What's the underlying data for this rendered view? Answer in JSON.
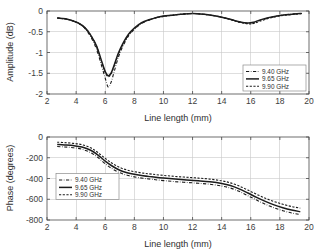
{
  "figure": {
    "background": "#ffffff",
    "panels": [
      "amplitude",
      "phase"
    ]
  },
  "chart_data": [
    {
      "type": "line",
      "id": "amplitude",
      "title": "",
      "xlabel": "Line length (mm)",
      "ylabel": "Amplitude (dB)",
      "xlim": [
        2,
        20
      ],
      "ylim": [
        -2,
        0
      ],
      "xticks": [
        2,
        4,
        6,
        8,
        10,
        12,
        14,
        16,
        18,
        20
      ],
      "xticklabels": [
        "2",
        "4",
        "6",
        "8",
        "10",
        "12",
        "14",
        "16",
        "18",
        "20"
      ],
      "yticks": [
        0,
        -0.5,
        -1,
        -1.5,
        -2
      ],
      "yticklabels": [
        "0",
        "-0.5",
        "-1",
        "-1.5",
        "-2"
      ],
      "grid": true,
      "legend_position": "lower right",
      "linecolor": "#1c1c1c",
      "series": [
        {
          "name": "9.40 GHz",
          "style": "dashdot",
          "x": [
            2.7,
            3.0,
            3.4,
            3.8,
            4.2,
            4.6,
            5.0,
            5.4,
            5.8,
            6.0,
            6.2,
            6.4,
            6.6,
            6.9,
            7.2,
            7.6,
            8.0,
            8.5,
            9.0,
            9.5,
            10.0,
            10.6,
            11.2,
            12.0,
            12.8,
            13.4,
            14.0,
            14.6,
            15.2,
            15.8,
            16.2,
            16.6,
            17.2,
            17.8,
            18.4,
            19.0,
            19.5
          ],
          "y": [
            -0.17,
            -0.18,
            -0.2,
            -0.24,
            -0.3,
            -0.42,
            -0.62,
            -0.92,
            -1.38,
            -1.62,
            -1.83,
            -1.72,
            -1.48,
            -1.12,
            -0.86,
            -0.6,
            -0.44,
            -0.3,
            -0.22,
            -0.16,
            -0.13,
            -0.1,
            -0.08,
            -0.06,
            -0.08,
            -0.11,
            -0.15,
            -0.2,
            -0.26,
            -0.3,
            -0.28,
            -0.23,
            -0.17,
            -0.12,
            -0.09,
            -0.07,
            -0.06
          ]
        },
        {
          "name": "9.65 GHz",
          "style": "solid",
          "x": [
            2.7,
            3.0,
            3.4,
            3.8,
            4.2,
            4.6,
            5.0,
            5.4,
            5.8,
            6.0,
            6.2,
            6.4,
            6.6,
            6.9,
            7.2,
            7.6,
            8.0,
            8.5,
            9.0,
            9.5,
            10.0,
            10.6,
            11.2,
            12.0,
            12.8,
            13.4,
            14.0,
            14.6,
            15.2,
            15.8,
            16.2,
            16.6,
            17.2,
            17.8,
            18.4,
            19.0,
            19.5
          ],
          "y": [
            -0.17,
            -0.18,
            -0.2,
            -0.24,
            -0.3,
            -0.4,
            -0.58,
            -0.84,
            -1.26,
            -1.46,
            -1.56,
            -1.5,
            -1.32,
            -1.02,
            -0.79,
            -0.56,
            -0.41,
            -0.28,
            -0.21,
            -0.16,
            -0.12,
            -0.1,
            -0.08,
            -0.06,
            -0.08,
            -0.11,
            -0.15,
            -0.2,
            -0.26,
            -0.29,
            -0.27,
            -0.22,
            -0.16,
            -0.12,
            -0.09,
            -0.07,
            -0.06
          ]
        },
        {
          "name": "9.90 GHz",
          "style": "dashed",
          "x": [
            2.7,
            3.0,
            3.4,
            3.8,
            4.2,
            4.6,
            5.0,
            5.4,
            5.8,
            6.0,
            6.2,
            6.4,
            6.6,
            6.9,
            7.2,
            7.6,
            8.0,
            8.5,
            9.0,
            9.5,
            10.0,
            10.6,
            11.2,
            12.0,
            12.8,
            13.4,
            14.0,
            14.6,
            15.2,
            15.8,
            16.2,
            16.6,
            17.2,
            17.8,
            18.4,
            19.0,
            19.5
          ],
          "y": [
            -0.17,
            -0.18,
            -0.2,
            -0.24,
            -0.3,
            -0.4,
            -0.58,
            -0.85,
            -1.28,
            -1.48,
            -1.58,
            -1.52,
            -1.34,
            -1.05,
            -0.82,
            -0.58,
            -0.43,
            -0.29,
            -0.22,
            -0.16,
            -0.13,
            -0.1,
            -0.08,
            -0.06,
            -0.08,
            -0.11,
            -0.15,
            -0.21,
            -0.27,
            -0.31,
            -0.3,
            -0.25,
            -0.18,
            -0.13,
            -0.1,
            -0.08,
            -0.06
          ]
        }
      ]
    },
    {
      "type": "line",
      "id": "phase",
      "title": "",
      "xlabel": "Line length (mm)",
      "ylabel": "Phase (degrees)",
      "xlim": [
        2,
        20
      ],
      "ylim": [
        -800,
        0
      ],
      "xticks": [
        2,
        4,
        6,
        8,
        10,
        12,
        14,
        16,
        18,
        20
      ],
      "xticklabels": [
        "2",
        "4",
        "6",
        "8",
        "10",
        "12",
        "14",
        "16",
        "18",
        "20"
      ],
      "yticks": [
        0,
        -200,
        -400,
        -600,
        -800
      ],
      "yticklabels": [
        "0",
        "-200",
        "-400",
        "-600",
        "-800"
      ],
      "grid": true,
      "legend_position": "center left",
      "linecolor": "#1c1c1c",
      "series": [
        {
          "name": "9.40 GHz",
          "style": "dashdot",
          "x": [
            2.7,
            3.2,
            3.8,
            4.4,
            5.0,
            5.5,
            6.0,
            6.5,
            7.0,
            7.5,
            8.0,
            8.6,
            9.2,
            10.0,
            10.8,
            11.6,
            12.4,
            13.2,
            14.0,
            14.6,
            15.2,
            15.8,
            16.4,
            17.0,
            17.6,
            18.2,
            18.8,
            19.4
          ],
          "y": [
            -92,
            -96,
            -103,
            -118,
            -150,
            -198,
            -258,
            -308,
            -345,
            -368,
            -384,
            -398,
            -408,
            -420,
            -430,
            -438,
            -446,
            -456,
            -472,
            -492,
            -524,
            -566,
            -608,
            -648,
            -682,
            -710,
            -732,
            -748
          ]
        },
        {
          "name": "9.65 GHz",
          "style": "solid",
          "x": [
            2.7,
            3.2,
            3.8,
            4.4,
            5.0,
            5.5,
            6.0,
            6.5,
            7.0,
            7.5,
            8.0,
            8.6,
            9.2,
            10.0,
            10.8,
            11.6,
            12.4,
            13.2,
            14.0,
            14.6,
            15.2,
            15.8,
            16.4,
            17.0,
            17.6,
            18.2,
            18.8,
            19.4
          ],
          "y": [
            -72,
            -76,
            -83,
            -97,
            -128,
            -174,
            -232,
            -282,
            -320,
            -344,
            -360,
            -374,
            -384,
            -396,
            -406,
            -414,
            -422,
            -432,
            -448,
            -468,
            -500,
            -540,
            -582,
            -620,
            -654,
            -682,
            -704,
            -720
          ]
        },
        {
          "name": "9.90 GHz",
          "style": "dashed",
          "x": [
            2.7,
            3.2,
            3.8,
            4.4,
            5.0,
            5.5,
            6.0,
            6.5,
            7.0,
            7.5,
            8.0,
            8.6,
            9.2,
            10.0,
            10.8,
            11.6,
            12.4,
            13.2,
            14.0,
            14.6,
            15.2,
            15.8,
            16.4,
            17.0,
            17.6,
            18.2,
            18.8,
            19.4
          ],
          "y": [
            -50,
            -54,
            -61,
            -74,
            -104,
            -150,
            -206,
            -256,
            -294,
            -318,
            -334,
            -348,
            -358,
            -370,
            -380,
            -388,
            -396,
            -406,
            -422,
            -442,
            -472,
            -512,
            -552,
            -590,
            -622,
            -648,
            -670,
            -686
          ]
        }
      ]
    }
  ]
}
